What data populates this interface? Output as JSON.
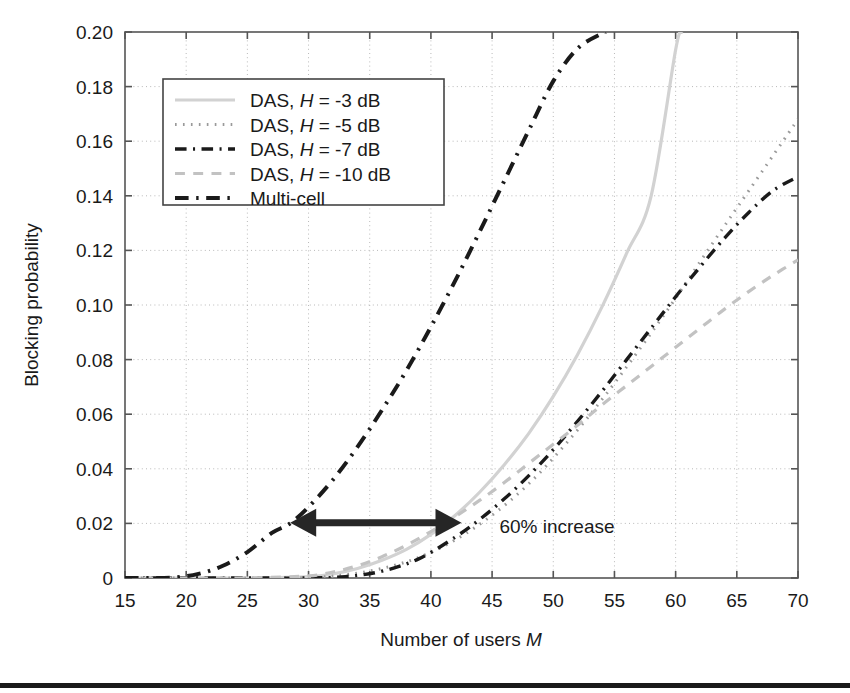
{
  "figure": {
    "background_color": "#ffffff",
    "plot_border_color": "#555555",
    "grid_color": "#b9b9b9"
  },
  "chart_data": {
    "type": "line",
    "title": "",
    "xlabel": "Number of users M",
    "xlabel_plain": "Number of users",
    "xlabel_italic": "M",
    "ylabel": "Blocking probability",
    "xlim": [
      15,
      70
    ],
    "ylim": [
      0,
      0.2
    ],
    "xticks": [
      15,
      20,
      25,
      30,
      35,
      40,
      45,
      50,
      55,
      60,
      65,
      70
    ],
    "yticks": [
      0,
      0.02,
      0.04,
      0.06,
      0.08,
      0.1,
      0.12,
      0.14,
      0.16,
      0.18,
      0.2
    ],
    "ytick_labels": [
      "0",
      "0.02",
      "0.04",
      "0.06",
      "0.08",
      "0.10",
      "0.12",
      "0.14",
      "0.16",
      "0.18",
      "0.20"
    ],
    "xtick_labels": [
      "15",
      "20",
      "25",
      "30",
      "35",
      "40",
      "45",
      "50",
      "55",
      "60",
      "65",
      "70"
    ],
    "grid": true,
    "grid_style": "dotted",
    "legend_position": "upper-left",
    "series": [
      {
        "name": "DAS, H = -3 dB",
        "label_plain_a": "DAS, ",
        "label_italic": "H",
        "label_plain_b": " = -3 dB",
        "style": "solid",
        "color": "#d2d2d2",
        "width": 3.2,
        "x": [
          15,
          20,
          25,
          30,
          32,
          34,
          36,
          38,
          40,
          42,
          44,
          46,
          48,
          50,
          52,
          54,
          56,
          58,
          60,
          60.5
        ],
        "y": [
          0.0,
          0.0,
          0.0,
          0.0005,
          0.0015,
          0.0035,
          0.0065,
          0.0105,
          0.016,
          0.023,
          0.0315,
          0.0415,
          0.053,
          0.0665,
          0.082,
          0.0995,
          0.119,
          0.14,
          0.1935,
          0.2
        ]
      },
      {
        "name": "DAS, H = -5 dB",
        "label_plain_a": "DAS, ",
        "label_italic": "H",
        "label_plain_b": " = -5 dB",
        "style": "dotted",
        "color": "#9a9a9a",
        "width": 3.0,
        "x": [
          15,
          20,
          25,
          30,
          33,
          36,
          39,
          42,
          45,
          48,
          51,
          54,
          57,
          60,
          63,
          66,
          70
        ],
        "y": [
          0.0,
          0.0,
          0.0,
          0.0002,
          0.0012,
          0.0035,
          0.0075,
          0.014,
          0.023,
          0.0345,
          0.049,
          0.0655,
          0.0835,
          0.1025,
          0.1225,
          0.142,
          0.168
        ]
      },
      {
        "name": "DAS, H = -7 dB",
        "label_plain_a": "DAS, ",
        "label_italic": "H",
        "label_plain_b": " = -7 dB",
        "style": "dashdot",
        "color": "#1a1a1a",
        "width": 3.4,
        "x": [
          15,
          20,
          25,
          30,
          33,
          36,
          39,
          42,
          44,
          46,
          48,
          50,
          52,
          54,
          56,
          58,
          60,
          62,
          64,
          66,
          68,
          70
        ],
        "y": [
          0.0,
          0.0,
          0.0,
          0.0,
          0.0005,
          0.0025,
          0.007,
          0.015,
          0.0215,
          0.029,
          0.0375,
          0.047,
          0.0575,
          0.0685,
          0.08,
          0.0915,
          0.103,
          0.114,
          0.1245,
          0.134,
          0.142,
          0.147
        ]
      },
      {
        "name": "DAS, H = -10 dB",
        "label_plain_a": "DAS, ",
        "label_italic": "H",
        "label_plain_b": " = -10 dB",
        "style": "dashed",
        "color": "#c2c2c2",
        "width": 3.2,
        "x": [
          15,
          20,
          25,
          30,
          32,
          34,
          36,
          38,
          40,
          42,
          44,
          46,
          48,
          50,
          52,
          54,
          56,
          58,
          60,
          62,
          64,
          66,
          68,
          70
        ],
        "y": [
          0.0,
          0.0,
          0.0,
          0.0008,
          0.0022,
          0.0045,
          0.0078,
          0.012,
          0.017,
          0.0225,
          0.0285,
          0.035,
          0.042,
          0.049,
          0.056,
          0.0635,
          0.0705,
          0.0775,
          0.0845,
          0.0915,
          0.0985,
          0.105,
          0.111,
          0.1165
        ]
      },
      {
        "name": "Multi-cell",
        "label_plain_a": "Multi-cell",
        "label_italic": "",
        "label_plain_b": "",
        "style": "dashdot",
        "color": "#1a1a1a",
        "width": 4.0,
        "x": [
          15,
          17,
          19,
          21,
          23,
          25,
          27,
          28.5,
          30,
          32,
          34,
          36,
          38,
          40,
          42,
          44,
          46,
          48,
          50,
          52,
          54,
          54.3
        ],
        "y": [
          0.0,
          0.0,
          0.0002,
          0.0015,
          0.0045,
          0.0095,
          0.0165,
          0.02,
          0.026,
          0.036,
          0.048,
          0.0615,
          0.076,
          0.092,
          0.109,
          0.127,
          0.1455,
          0.164,
          0.182,
          0.194,
          0.1995,
          0.2
        ]
      }
    ],
    "annotations": [
      {
        "name": "increase-arrow",
        "type": "double-arrow",
        "x_start": 28.5,
        "x_end": 42.5,
        "y": 0.0202,
        "color": "#262626"
      },
      {
        "name": "increase-label",
        "type": "text",
        "text": "60% increase",
        "x": 45.6,
        "y": 0.0165,
        "color": "#1a1a1a"
      }
    ]
  }
}
